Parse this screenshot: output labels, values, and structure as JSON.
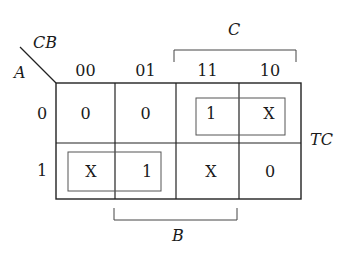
{
  "kmap": {
    "row_variable": "A",
    "col_variable": "CB",
    "col_headers": [
      "00",
      "01",
      "11",
      "10"
    ],
    "row_headers": [
      "0",
      "1"
    ],
    "cells": [
      [
        "0",
        "0",
        "1",
        "X"
      ],
      [
        "X",
        "1",
        "X",
        "0"
      ]
    ],
    "brackets": {
      "top": "C",
      "bottom": "B"
    },
    "output_label": "TC",
    "groups": [
      {
        "row": 0,
        "cols": [
          2,
          3
        ]
      },
      {
        "row": 1,
        "cols": [
          0,
          1
        ]
      }
    ]
  }
}
